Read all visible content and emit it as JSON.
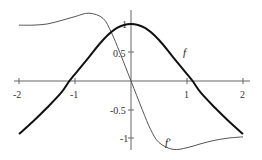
{
  "chart_data": {
    "type": "line",
    "title": "",
    "xlabel": "",
    "ylabel": "",
    "xlim": [
      -2,
      2
    ],
    "ylim": [
      -1.2,
      1.2
    ],
    "grid": false,
    "x_ticks": [
      -2,
      -1,
      1,
      2
    ],
    "x_tick_labels": [
      "-2",
      "-1",
      "1",
      "2"
    ],
    "y_ticks": [
      1,
      0.5,
      -0.5,
      -1
    ],
    "y_tick_labels": [
      "1",
      "0.5",
      "-0.5",
      "-1"
    ],
    "series": [
      {
        "name": "f",
        "style": "thick",
        "x": [
          -2,
          -1.75,
          -1.5,
          -1.25,
          -1.1,
          -1,
          -0.75,
          -0.5,
          -0.25,
          0,
          0.25,
          0.5,
          0.75,
          1,
          1.1,
          1.25,
          1.5,
          1.75,
          2
        ],
        "y": [
          -0.93,
          -0.71,
          -0.47,
          -0.21,
          0.0,
          0.12,
          0.42,
          0.72,
          0.93,
          1.0,
          0.93,
          0.72,
          0.42,
          0.12,
          0.0,
          -0.21,
          -0.47,
          -0.71,
          -0.93
        ]
      },
      {
        "name": "f'",
        "style": "thin",
        "x": [
          -2,
          -1.75,
          -1.5,
          -1.25,
          -1,
          -0.75,
          -0.5,
          -0.35,
          -0.2,
          0,
          0.2,
          0.35,
          0.5,
          0.75,
          1,
          1.25,
          1.5,
          1.75,
          2
        ],
        "y": [
          0.98,
          0.98,
          1.0,
          1.06,
          1.13,
          1.19,
          1.1,
          0.85,
          0.5,
          0.0,
          -0.5,
          -0.85,
          -1.08,
          -1.2,
          -1.17,
          -1.1,
          -1.04,
          -1.0,
          -0.98
        ]
      }
    ],
    "annotations": [
      {
        "text": "f",
        "x": 0.95,
        "y": 0.5
      },
      {
        "text": "f'",
        "x": 0.7,
        "y": -1.1
      }
    ]
  },
  "labels": {
    "f": "f",
    "fprime": "f'",
    "xt": [
      "-2",
      "-1",
      "1",
      "2"
    ],
    "yt": [
      "1",
      "0.5",
      "-0.5",
      "-1"
    ]
  }
}
